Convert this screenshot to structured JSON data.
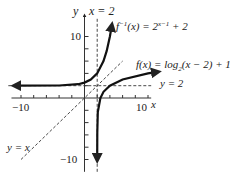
{
  "chart_data": {
    "type": "line",
    "title": "",
    "xlabel": "x",
    "ylabel": "y",
    "xlim": [
      -12,
      12
    ],
    "ylim": [
      -12,
      13
    ],
    "x_tick_labels": [
      "-10",
      "10"
    ],
    "y_tick_labels": [
      "10",
      "-10"
    ],
    "tick_step": 2,
    "grid": false,
    "series": [
      {
        "name": "f^{-1}(x) = 2^{x-1} + 2",
        "style": "solid-thick-arrows",
        "asymptote": "y = 2",
        "points": [
          [
            -11,
            2.0
          ],
          [
            -4,
            2.03
          ],
          [
            -1,
            2.25
          ],
          [
            0,
            2.5
          ],
          [
            1,
            3
          ],
          [
            2,
            4
          ],
          [
            3,
            6
          ],
          [
            3.5,
            7.66
          ],
          [
            4,
            10
          ],
          [
            4.3,
            11.8
          ]
        ]
      },
      {
        "name": "f(x) = log_2(x-2) + 1",
        "style": "solid-thick-arrows",
        "asymptote": "x = 2",
        "points": [
          [
            2.0005,
            -10
          ],
          [
            2.01,
            -5.6
          ],
          [
            2.1,
            -2.3
          ],
          [
            2.5,
            0
          ],
          [
            3,
            1
          ],
          [
            4,
            2
          ],
          [
            6,
            3
          ],
          [
            10,
            4
          ],
          [
            11.5,
            4.25
          ]
        ]
      },
      {
        "name": "y = x",
        "style": "dashed",
        "points": [
          [
            -10,
            -10
          ],
          [
            6,
            6
          ]
        ]
      },
      {
        "name": "x = 2",
        "style": "dashed",
        "points": [
          [
            2,
            -12
          ],
          [
            2,
            13
          ]
        ]
      },
      {
        "name": "y = 2",
        "style": "dashed",
        "points": [
          [
            -12,
            2
          ],
          [
            10.5,
            2
          ]
        ]
      }
    ],
    "annotations": [
      {
        "text": "y",
        "role": "y-axis-label"
      },
      {
        "text": "x",
        "role": "x-axis-label"
      },
      {
        "text": "x = 2",
        "role": "vertical-asymptote-label"
      },
      {
        "text": "y = 2",
        "role": "horizontal-asymptote-label"
      },
      {
        "text": "y = x",
        "role": "identity-line-label"
      },
      {
        "text": "f⁻¹(x) = 2ˣ⁻¹ + 2",
        "role": "inverse-function-label"
      },
      {
        "text": "f(x) = log₂(x − 2) + 1",
        "role": "function-label"
      }
    ]
  },
  "labels": {
    "y_axis": "y",
    "x_axis": "x",
    "x_eq_2": "x = 2",
    "y_eq_2": "y = 2",
    "y_eq_x": "y = x",
    "tick_y_pos": "10",
    "tick_y_neg": "−10",
    "tick_x_neg": "−10",
    "tick_x_pos": "10",
    "finv_f": "f",
    "finv_sup": "−1",
    "finv_rest": "(x) = 2",
    "finv_exp": "x−1",
    "finv_tail": " + 2",
    "f_label": "f(x) = log",
    "f_sub": "2",
    "f_tail": "(x − 2) + 1"
  }
}
